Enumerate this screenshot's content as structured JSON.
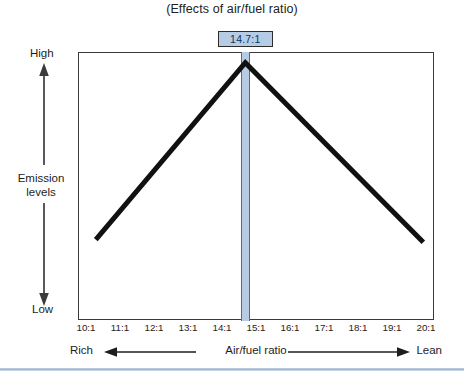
{
  "chart_data": {
    "type": "line",
    "title": "(Effects of air/fuel ratio)",
    "xlabel": "Air/fuel ratio",
    "ylabel": "Emission levels",
    "grid": false,
    "legend": "none",
    "xlim": [
      10,
      20
    ],
    "ylim": [
      0,
      1
    ],
    "xticklabels": [
      "10:1",
      "11:1",
      "12:1",
      "13:1",
      "14:1",
      "15:1",
      "16:1",
      "17:1",
      "18:1",
      "19:1",
      "20:1"
    ],
    "xtickvalues": [
      10,
      11,
      12,
      13,
      14,
      15,
      16,
      17,
      18,
      19,
      20
    ],
    "yticklabels": [
      "Low",
      "High"
    ],
    "y_axis_low_label": "Low",
    "y_axis_high_label": "High",
    "x_axis_left_label": "Rich",
    "x_axis_right_label": "Lean",
    "series": [
      {
        "name": "Emission levels",
        "color": "#111111",
        "x": [
          10.5,
          14.7,
          19.7
        ],
        "y": [
          0.3,
          0.96,
          0.29
        ]
      }
    ],
    "annotations": [
      {
        "label": "14.7:1",
        "x": 14.7,
        "type": "vertical-band",
        "band_color": "#b6cce4",
        "box_fill": "#b6cce4",
        "box_border": "#2c2c2c",
        "text_color": "#10325e"
      }
    ]
  },
  "title": {
    "text": "(Effects of air/fuel ratio)"
  },
  "y_axis": {
    "high": "High",
    "mid_line1": "Emission",
    "mid_line2": "levels",
    "low": "Low"
  },
  "x_axis": {
    "ticks": [
      "10:1",
      "11:1",
      "12:1",
      "13:1",
      "14:1",
      "15:1",
      "16:1",
      "17:1",
      "18:1",
      "19:1",
      "20:1"
    ],
    "left_label": "Rich",
    "center_label": "Air/fuel ratio",
    "right_label": "Lean"
  },
  "callout": {
    "value": "14.7:1"
  },
  "colors": {
    "band": "#b6cce4",
    "band_edge": "#55698a",
    "curve": "#111111",
    "frame": "#3a3a3a",
    "callout_text": "#10325e",
    "divider": "#9fb4ce"
  }
}
